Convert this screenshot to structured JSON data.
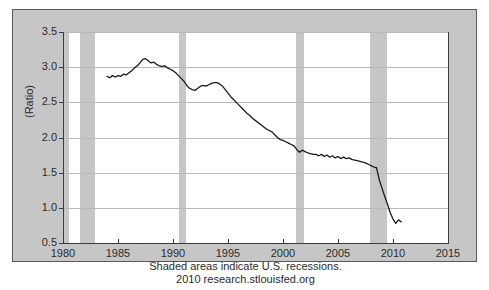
{
  "chart_data": {
    "type": "line",
    "title": "",
    "xlabel": "",
    "ylabel": "(Ratio)",
    "xlim": [
      1980,
      2015
    ],
    "ylim": [
      0.5,
      3.5
    ],
    "grid": true,
    "legend": "none",
    "x_ticks": [
      "1980",
      "1985",
      "1990",
      "1995",
      "2000",
      "2005",
      "2010",
      "2015"
    ],
    "x_tick_values": [
      1980,
      1985,
      1990,
      1995,
      2000,
      2005,
      2010,
      2015
    ],
    "y_ticks": [
      "0.5",
      "1.0",
      "1.5",
      "2.0",
      "2.5",
      "3.0",
      "3.5"
    ],
    "y_tick_values": [
      0.5,
      1.0,
      1.5,
      2.0,
      2.5,
      3.0,
      3.5
    ],
    "series": [
      {
        "name": "Ratio",
        "color": "#1a1a1a",
        "x": [
          1984.0,
          1984.25,
          1984.5,
          1984.75,
          1985.0,
          1985.25,
          1985.5,
          1985.75,
          1986.0,
          1986.25,
          1986.5,
          1986.75,
          1987.0,
          1987.25,
          1987.5,
          1987.75,
          1988.0,
          1988.25,
          1988.5,
          1988.75,
          1989.0,
          1989.25,
          1989.5,
          1989.75,
          1990.0,
          1990.25,
          1990.5,
          1990.75,
          1991.0,
          1991.25,
          1991.5,
          1991.75,
          1992.0,
          1992.25,
          1992.5,
          1992.75,
          1993.0,
          1993.25,
          1993.5,
          1993.75,
          1994.0,
          1994.25,
          1994.5,
          1994.75,
          1995.0,
          1995.25,
          1995.5,
          1995.75,
          1996.0,
          1996.25,
          1996.5,
          1996.75,
          1997.0,
          1997.25,
          1997.5,
          1997.75,
          1998.0,
          1998.25,
          1998.5,
          1998.75,
          1999.0,
          1999.25,
          1999.5,
          1999.75,
          2000.0,
          2000.25,
          2000.5,
          2000.75,
          2001.0,
          2001.25,
          2001.5,
          2001.75,
          2002.0,
          2002.25,
          2002.5,
          2002.75,
          2003.0,
          2003.25,
          2003.5,
          2003.75,
          2004.0,
          2004.25,
          2004.5,
          2004.75,
          2005.0,
          2005.25,
          2005.5,
          2005.75,
          2006.0,
          2006.25,
          2006.5,
          2006.75,
          2007.0,
          2007.25,
          2007.5,
          2007.75,
          2008.0,
          2008.25,
          2008.5,
          2008.75,
          2009.0,
          2009.25,
          2009.5,
          2009.75,
          2010.0,
          2010.25,
          2010.5,
          2010.75
        ],
        "y": [
          2.87,
          2.85,
          2.88,
          2.86,
          2.88,
          2.87,
          2.9,
          2.89,
          2.92,
          2.95,
          2.99,
          3.02,
          3.06,
          3.11,
          3.12,
          3.09,
          3.06,
          3.07,
          3.04,
          3.02,
          3.01,
          3.02,
          2.99,
          2.97,
          2.95,
          2.92,
          2.88,
          2.84,
          2.8,
          2.74,
          2.7,
          2.68,
          2.67,
          2.7,
          2.73,
          2.74,
          2.73,
          2.75,
          2.77,
          2.78,
          2.78,
          2.76,
          2.73,
          2.68,
          2.63,
          2.58,
          2.54,
          2.5,
          2.46,
          2.42,
          2.38,
          2.34,
          2.31,
          2.27,
          2.24,
          2.21,
          2.18,
          2.15,
          2.12,
          2.1,
          2.08,
          2.04,
          2.0,
          1.97,
          1.96,
          1.94,
          1.92,
          1.9,
          1.88,
          1.83,
          1.79,
          1.82,
          1.8,
          1.78,
          1.77,
          1.76,
          1.76,
          1.74,
          1.76,
          1.73,
          1.75,
          1.72,
          1.74,
          1.71,
          1.73,
          1.7,
          1.72,
          1.7,
          1.71,
          1.69,
          1.68,
          1.67,
          1.66,
          1.65,
          1.64,
          1.62,
          1.6,
          1.58,
          1.57,
          1.4,
          1.28,
          1.16,
          1.05,
          0.93,
          0.84,
          0.78,
          0.83,
          0.8
        ]
      }
    ],
    "recession_bands": [
      {
        "start": 1980.0,
        "end": 1980.55,
        "label": "1980 recession"
      },
      {
        "start": 1981.5,
        "end": 1982.9,
        "label": "1981-82 recession"
      },
      {
        "start": 1990.5,
        "end": 1991.2,
        "label": "1990-91 recession"
      },
      {
        "start": 2001.2,
        "end": 2001.9,
        "label": "2001 recession"
      },
      {
        "start": 2007.9,
        "end": 2009.5,
        "label": "2007-09 recession"
      }
    ],
    "band_color": "#c6c6c6",
    "plot_background": "#ffffff",
    "figure_background": "#c6c6c6",
    "gridline_color": "#b9b9b9",
    "axis_color": "#3b3b3b",
    "annotations": [
      "Shaded areas indicate U.S. recessions.",
      "2010 research.stlouisfed.org"
    ]
  },
  "caption": {
    "line1": "Shaded areas indicate U.S. recessions.",
    "line2": "2010 research.stlouisfed.org"
  }
}
